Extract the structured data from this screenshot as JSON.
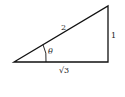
{
  "diagram": {
    "type": "right-triangle",
    "labels": {
      "hypotenuse": "2",
      "opposite": "1",
      "adjacent": "√3",
      "angle": "θ"
    },
    "colors": {
      "stroke": "#111111",
      "background": "#ffffff"
    }
  }
}
